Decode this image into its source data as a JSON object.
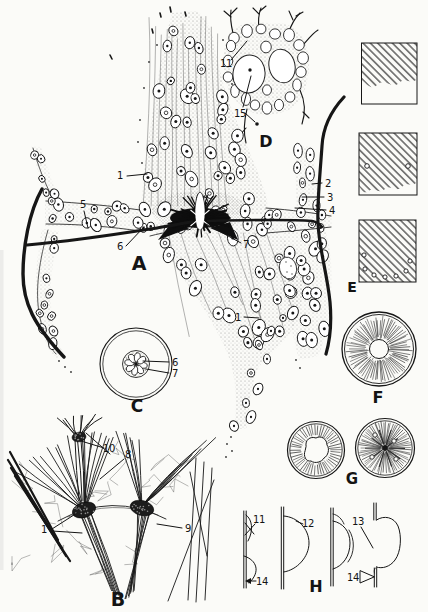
{
  "figure": {
    "background_color": "#fbfbf8",
    "ink_color": "#161616",
    "panels": {
      "A": {
        "letter": "A",
        "annotations": {
          "n1_top": "1",
          "n5": "5",
          "n6": "6",
          "n7": "7",
          "n2": "2",
          "n3": "3",
          "n4": "4",
          "n1_lower": "1"
        }
      },
      "B": {
        "letter": "B",
        "annotations": {
          "n10": "10",
          "n8": "8",
          "n1": "1",
          "n9": "9"
        }
      },
      "C": {
        "letter": "C",
        "annotations": {
          "n6": "6",
          "n7": "7"
        }
      },
      "D": {
        "letter": "D",
        "annotations": {
          "n11": "11",
          "n15": "15"
        }
      },
      "E": {
        "letter": "E"
      },
      "F": {
        "letter": "F"
      },
      "G": {
        "letter": "G"
      },
      "H": {
        "letter": "H",
        "annotations": {
          "n11": "11",
          "n12": "12",
          "n13": "13",
          "n14_left": "14",
          "n14_right": "14"
        }
      }
    }
  }
}
